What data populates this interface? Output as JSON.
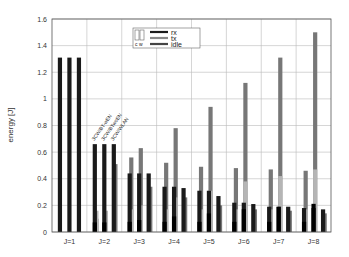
{
  "chart_data": {
    "type": "bar",
    "title": "",
    "xlabel": "",
    "ylabel": "energy [J]",
    "ylim": [
      0,
      1.6
    ],
    "yticks": [
      0,
      0.2,
      0.4,
      0.6,
      0.8,
      1,
      1.2,
      1.4,
      1.6
    ],
    "ytick_labels": [
      "0",
      "0.2",
      "0.4",
      "0.6",
      "0.8",
      "1",
      "1.2",
      "1.4",
      "1.6"
    ],
    "grid": true,
    "categories": [
      "J=1",
      "J=2",
      "J=3",
      "J=4",
      "J=5",
      "J=6",
      "J=7",
      "J=8"
    ],
    "configurations": [
      "3CW/BT-wEN",
      "3CW/BTwoEN",
      "3CW/WLAN"
    ],
    "annotation": [
      "3CW/BT-wEN",
      "3CW/BTwoEN",
      "3CW/WLAN"
    ],
    "legend": {
      "position": "upper right",
      "entries": [
        "rx",
        "tx",
        "idle"
      ],
      "colors": [
        "#1a1a1a",
        "#777777",
        "#444444"
      ]
    },
    "series": [
      {
        "name": "3CW/BT-wEN",
        "values": [
          {
            "dark": 1.31,
            "gray": 0,
            "light": 0
          },
          {
            "dark": 0.66,
            "gray": 0.1,
            "light": 0.16
          },
          {
            "dark": 0.44,
            "gray": 0.56,
            "light": 0.17
          },
          {
            "dark": 0.34,
            "gray": 0.52,
            "light": 0.17
          },
          {
            "dark": 0.31,
            "gray": 0.49,
            "light": 0.17
          },
          {
            "dark": 0.22,
            "gray": 0.48,
            "light": 0.17
          },
          {
            "dark": 0.19,
            "gray": 0.47,
            "light": 0.17
          },
          {
            "dark": 0.18,
            "gray": 0.46,
            "light": 0.17
          }
        ]
      },
      {
        "name": "3CW/BTwoEN",
        "values": [
          {
            "dark": 1.31,
            "gray": 0,
            "light": 0
          },
          {
            "dark": 0.66,
            "gray": 0.1,
            "light": 0.16
          },
          {
            "dark": 0.44,
            "gray": 0.63,
            "light": 0.2
          },
          {
            "dark": 0.34,
            "gray": 0.78,
            "light": 0.26
          },
          {
            "dark": 0.31,
            "gray": 0.94,
            "light": 0.31
          },
          {
            "dark": 0.22,
            "gray": 1.12,
            "light": 0.38
          },
          {
            "dark": 0.19,
            "gray": 1.31,
            "light": 0.42
          },
          {
            "dark": 0.18,
            "gray": 1.5,
            "light": 0.47
          }
        ]
      },
      {
        "name": "3CW/WLAN",
        "values": [
          {
            "dark": 1.31,
            "gray": 0,
            "light": 0
          },
          {
            "dark": 0.66,
            "gray": 0.51,
            "light": 0
          },
          {
            "dark": 0.44,
            "gray": 0.34,
            "light": 0
          },
          {
            "dark": 0.33,
            "gray": 0.26,
            "light": 0
          },
          {
            "dark": 0.27,
            "gray": 0.2,
            "light": 0
          },
          {
            "dark": 0.21,
            "gray": 0.17,
            "light": 0
          },
          {
            "dark": 0.19,
            "gray": 0.16,
            "light": 0
          },
          {
            "dark": 0.17,
            "gray": 0.14,
            "light": 0
          }
        ]
      }
    ]
  },
  "legend_box_icon": "bar-style-icon",
  "legend_box_icon_label": "c w"
}
